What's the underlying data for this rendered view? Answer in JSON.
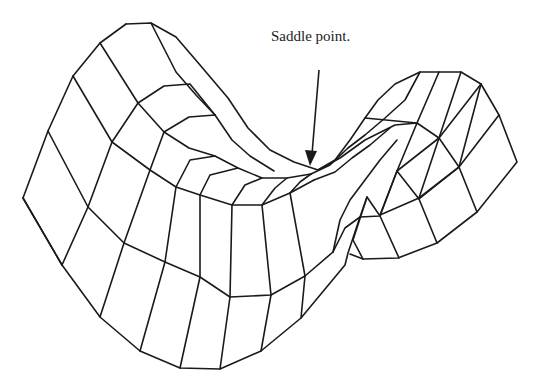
{
  "diagram": {
    "annotation": {
      "text": "Saddle point.",
      "arrow": {
        "from": [
          319,
          70
        ],
        "to": [
          311,
          164
        ]
      }
    },
    "colors": {
      "stroke": "#1a1a1a",
      "background": "#ffffff"
    },
    "mesh_lines": [
      [
        [
          126,
          24
        ],
        [
          151,
          23
        ],
        [
          176,
          37
        ],
        [
          200,
          65
        ],
        [
          228,
          98
        ],
        [
          248,
          128
        ],
        [
          270,
          150
        ],
        [
          294,
          162
        ],
        [
          318,
          170
        ],
        [
          335,
          160
        ],
        [
          350,
          140
        ],
        [
          365,
          118
        ],
        [
          378,
          100
        ],
        [
          395,
          84
        ],
        [
          420,
          72
        ],
        [
          439,
          72
        ],
        [
          461,
          72
        ],
        [
          481,
          84
        ],
        [
          499,
          115
        ],
        [
          517,
          162
        ],
        [
          477,
          212
        ],
        [
          437,
          243
        ],
        [
          398,
          258
        ],
        [
          363,
          259
        ],
        [
          350,
          254
        ]
      ],
      [
        [
          126,
          24
        ],
        [
          100,
          43
        ],
        [
          73,
          76
        ],
        [
          48,
          131
        ],
        [
          23,
          198
        ],
        [
          62,
          265
        ],
        [
          100,
          317
        ],
        [
          140,
          351
        ],
        [
          180,
          368
        ],
        [
          220,
          369
        ],
        [
          261,
          351
        ],
        [
          301,
          318
        ],
        [
          345,
          265
        ],
        [
          348,
          253
        ],
        [
          360,
          217
        ],
        [
          367,
          197
        ]
      ],
      [
        [
          100,
          43
        ],
        [
          138,
          103
        ],
        [
          164,
          132
        ],
        [
          189,
          148
        ],
        [
          215,
          156
        ],
        [
          238,
          168
        ],
        [
          262,
          178
        ],
        [
          287,
          178
        ],
        [
          311,
          174
        ]
      ],
      [
        [
          73,
          76
        ],
        [
          112,
          142
        ],
        [
          150,
          170
        ],
        [
          176,
          187
        ],
        [
          200,
          195
        ],
        [
          232,
          205
        ],
        [
          262,
          205
        ],
        [
          290,
          193
        ],
        [
          314,
          180
        ]
      ],
      [
        [
          48,
          131
        ],
        [
          88,
          207
        ],
        [
          124,
          243
        ],
        [
          165,
          262
        ],
        [
          200,
          277
        ],
        [
          230,
          297
        ],
        [
          271,
          295
        ],
        [
          305,
          276
        ],
        [
          333,
          252
        ]
      ],
      [
        [
          23,
          198
        ],
        [
          62,
          265
        ]
      ],
      [
        [
          151,
          23
        ],
        [
          176,
          72
        ],
        [
          196,
          95
        ],
        [
          215,
          115
        ],
        [
          232,
          140
        ],
        [
          250,
          156
        ],
        [
          274,
          171
        ]
      ],
      [
        [
          138,
          103
        ],
        [
          164,
          86
        ],
        [
          190,
          84
        ],
        [
          215,
          115
        ]
      ],
      [
        [
          112,
          142
        ],
        [
          138,
          103
        ]
      ],
      [
        [
          88,
          207
        ],
        [
          112,
          142
        ]
      ],
      [
        [
          62,
          265
        ],
        [
          88,
          207
        ]
      ],
      [
        [
          164,
          132
        ],
        [
          189,
          117
        ],
        [
          215,
          115
        ]
      ],
      [
        [
          150,
          170
        ],
        [
          164,
          132
        ]
      ],
      [
        [
          124,
          243
        ],
        [
          150,
          170
        ]
      ],
      [
        [
          100,
          317
        ],
        [
          124,
          243
        ]
      ],
      [
        [
          176,
          187
        ],
        [
          190,
          160
        ],
        [
          215,
          156
        ]
      ],
      [
        [
          165,
          262
        ],
        [
          176,
          187
        ]
      ],
      [
        [
          140,
          351
        ],
        [
          165,
          262
        ]
      ],
      [
        [
          200,
          195
        ],
        [
          210,
          175
        ],
        [
          238,
          168
        ]
      ],
      [
        [
          200,
          277
        ],
        [
          200,
          195
        ]
      ],
      [
        [
          180,
          368
        ],
        [
          200,
          277
        ]
      ],
      [
        [
          232,
          205
        ],
        [
          245,
          185
        ],
        [
          262,
          178
        ]
      ],
      [
        [
          230,
          297
        ],
        [
          232,
          205
        ]
      ],
      [
        [
          220,
          369
        ],
        [
          230,
          297
        ]
      ],
      [
        [
          262,
          205
        ],
        [
          275,
          188
        ],
        [
          287,
          178
        ]
      ],
      [
        [
          271,
          295
        ],
        [
          262,
          205
        ]
      ],
      [
        [
          261,
          351
        ],
        [
          271,
          295
        ]
      ],
      [
        [
          290,
          193
        ],
        [
          300,
          182
        ],
        [
          311,
          174
        ]
      ],
      [
        [
          305,
          276
        ],
        [
          290,
          193
        ]
      ],
      [
        [
          301,
          318
        ],
        [
          305,
          276
        ]
      ],
      [
        [
          318,
          170
        ],
        [
          340,
          158
        ],
        [
          365,
          140
        ],
        [
          395,
          125
        ],
        [
          417,
          123
        ],
        [
          439,
          138
        ],
        [
          459,
          167
        ],
        [
          477,
          212
        ]
      ],
      [
        [
          333,
          252
        ],
        [
          345,
          228
        ],
        [
          360,
          217
        ],
        [
          380,
          216
        ],
        [
          397,
          171
        ],
        [
          419,
          199
        ],
        [
          437,
          243
        ]
      ],
      [
        [
          363,
          259
        ],
        [
          353,
          240
        ],
        [
          367,
          197
        ],
        [
          380,
          216
        ],
        [
          399,
          258
        ]
      ],
      [
        [
          380,
          215
        ],
        [
          397,
          171
        ],
        [
          417,
          123
        ],
        [
          439,
          72
        ]
      ],
      [
        [
          419,
          198
        ],
        [
          439,
          138
        ],
        [
          461,
          72
        ]
      ],
      [
        [
          419,
          199
        ],
        [
          459,
          167
        ],
        [
          481,
          84
        ]
      ],
      [
        [
          380,
          215
        ],
        [
          419,
          198
        ],
        [
          459,
          167
        ],
        [
          499,
          115
        ]
      ],
      [
        [
          397,
          171
        ],
        [
          439,
          138
        ],
        [
          481,
          84
        ]
      ],
      [
        [
          365,
          118
        ],
        [
          417,
          123
        ]
      ],
      [
        [
          311,
          174
        ],
        [
          330,
          165
        ],
        [
          348,
          148
        ],
        [
          365,
          135
        ],
        [
          385,
          118
        ],
        [
          405,
          100
        ],
        [
          420,
          72
        ]
      ],
      [
        [
          314,
          180
        ],
        [
          335,
          172
        ],
        [
          352,
          158
        ],
        [
          370,
          145
        ],
        [
          390,
          128
        ]
      ],
      [
        [
          333,
          252
        ],
        [
          340,
          220
        ],
        [
          350,
          200
        ],
        [
          365,
          180
        ],
        [
          380,
          160
        ],
        [
          397,
          140
        ]
      ]
    ]
  }
}
